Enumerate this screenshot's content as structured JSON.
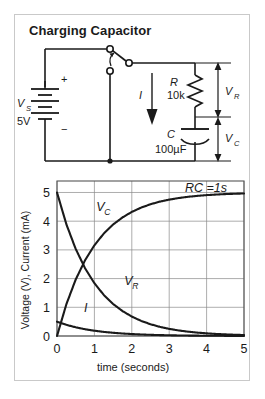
{
  "figure": {
    "title": "Charging Capacitor",
    "border_color": "#c9c9c9"
  },
  "circuit": {
    "source": {
      "name_label": "V",
      "name_sub": "S",
      "value_label": "5V",
      "plus_sign": "+",
      "minus_sign": "−"
    },
    "switch": {
      "name": "spdt-switch"
    },
    "current": {
      "label": "I"
    },
    "resistor": {
      "name_label": "R",
      "value_label": "10k"
    },
    "capacitor": {
      "name_label": "C",
      "value_label": "100µF"
    },
    "measurements": [
      {
        "label": "V",
        "sub": "R"
      },
      {
        "label": "V",
        "sub": "C"
      }
    ]
  },
  "chart_data": {
    "type": "line",
    "title": "",
    "annotation": "RC =1s",
    "xlabel": "time (seconds)",
    "ylabel": "Voltage (V), Current (mA)",
    "xlim": [
      0,
      5
    ],
    "ylim": [
      0,
      5.4
    ],
    "xticks": [
      "0",
      "1",
      "2",
      "3",
      "4",
      "5"
    ],
    "yticks": [
      "0",
      "1",
      "2",
      "3",
      "4",
      "5"
    ],
    "grid": true,
    "legend": "inline-labels",
    "tau": 1,
    "x": [
      0,
      0.25,
      0.5,
      0.75,
      1,
      1.25,
      1.5,
      1.75,
      2,
      2.25,
      2.5,
      2.75,
      3,
      3.25,
      3.5,
      3.75,
      4,
      4.25,
      4.5,
      4.75,
      5
    ],
    "series": [
      {
        "name": "V_C",
        "label": "V",
        "sublabel": "C",
        "label_x": 1.05,
        "label_y": 4.35,
        "color": "#1a1a1a",
        "values": [
          0,
          1.105,
          1.967,
          2.638,
          3.161,
          3.568,
          3.884,
          4.13,
          4.323,
          4.473,
          4.59,
          4.681,
          4.751,
          4.806,
          4.849,
          4.882,
          4.908,
          4.928,
          4.944,
          4.956,
          4.966
        ]
      },
      {
        "name": "V_R",
        "label": "V",
        "sublabel": "R",
        "label_x": 1.8,
        "label_y": 1.78,
        "color": "#1a1a1a",
        "values": [
          5,
          3.895,
          3.033,
          2.362,
          1.839,
          1.432,
          1.116,
          0.87,
          0.677,
          0.527,
          0.41,
          0.319,
          0.249,
          0.194,
          0.151,
          0.118,
          0.092,
          0.072,
          0.056,
          0.044,
          0.034
        ]
      },
      {
        "name": "I",
        "label": "I",
        "sublabel": "",
        "label_x": 0.72,
        "label_y": 0.85,
        "color": "#1a1a1a",
        "values": [
          0.5,
          0.389,
          0.303,
          0.236,
          0.184,
          0.143,
          0.112,
          0.087,
          0.068,
          0.053,
          0.041,
          0.032,
          0.025,
          0.019,
          0.015,
          0.012,
          0.009,
          0.007,
          0.006,
          0.004,
          0.003
        ]
      }
    ]
  }
}
